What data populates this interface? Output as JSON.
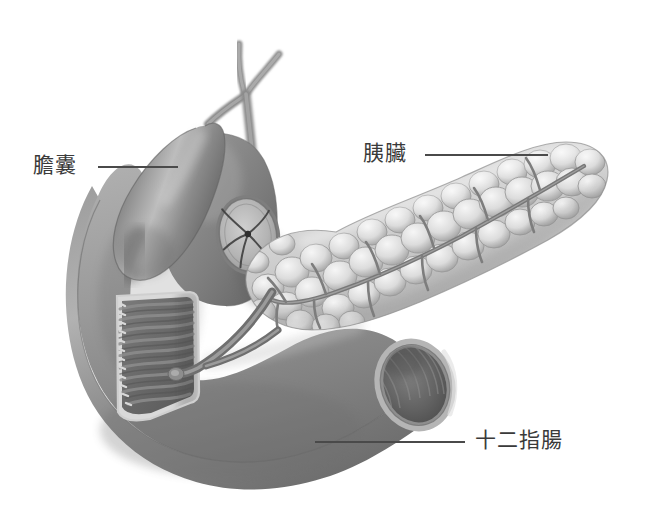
{
  "figure": {
    "background_color": "#ffffff",
    "width": 656,
    "height": 523,
    "style": "grayscale airbrush medical illustration",
    "label_color": "#3a3a3a",
    "leader_line_color": "#4a4a4a"
  },
  "labels": [
    {
      "id": "gallbladder",
      "text": "膽囊",
      "language": "zh-Hant",
      "meaning": "gallbladder",
      "text_x": 33,
      "text_y": 155,
      "leader_line": {
        "x1": 98,
        "y1": 167,
        "x2": 178,
        "y2": 167
      }
    },
    {
      "id": "pancreas",
      "text": "胰臟",
      "language": "zh-Hant",
      "meaning": "pancreas",
      "text_x": 363,
      "text_y": 143,
      "leader_line": {
        "x1": 425,
        "y1": 155,
        "x2": 548,
        "y2": 155
      }
    },
    {
      "id": "duodenum",
      "text": "十二指腸",
      "language": "zh-Hant",
      "meaning": "duodenum",
      "text_x": 475,
      "text_y": 430,
      "leader_line": {
        "x1": 315,
        "y1": 442,
        "x2": 465,
        "y2": 442
      }
    }
  ],
  "structures": [
    {
      "id": "hepatic-ducts",
      "name": "hepatic duct branches",
      "tone": "#8e8e8e"
    },
    {
      "id": "common-bile-duct",
      "name": "common bile duct",
      "tone": "#8a8a8a"
    },
    {
      "id": "gallbladder-body",
      "name": "gallbladder",
      "tone": "#7d7d7d"
    },
    {
      "id": "duodenal-bulb",
      "name": "duodenal bulb",
      "tone": "#8a8a8a"
    },
    {
      "id": "pyloric-sphincter",
      "name": "pyloric sphincter opening",
      "tone": "#b3b3b3"
    },
    {
      "id": "duodenum-body",
      "name": "duodenum",
      "tone": "#909090"
    },
    {
      "id": "duodenum-window",
      "name": "duodenal cut-away window with mucosal folds",
      "tone": "#6a6a6a"
    },
    {
      "id": "ampulla-of-vater",
      "name": "ampulla of Vater",
      "tone": "#787878"
    },
    {
      "id": "pancreas-body",
      "name": "pancreas (lobulated)",
      "tone": "#d8d8d8"
    },
    {
      "id": "pancreatic-duct",
      "name": "pancreatic duct",
      "tone": "#787878"
    },
    {
      "id": "duodenum-cut-end",
      "name": "duodenum cut end lumen",
      "tone": "#5f5f5f"
    }
  ]
}
